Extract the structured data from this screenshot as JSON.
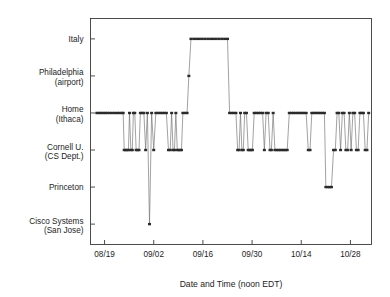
{
  "chart_data": {
    "type": "line",
    "title": "",
    "subtitle": "",
    "xlabel": "Date and Time (noon EDT)",
    "ylabel": "",
    "grid": false,
    "legend": null,
    "legend_position": "none",
    "marker": "square",
    "line_style": "step-connected",
    "series_color": "#2b2b2b",
    "y_type": "categorical",
    "y_categories": [
      "Cisco Systems\n(San Jose)",
      "Princeton",
      "Cornell U.\n(CS Dept.)",
      "Home\n(Ithaca)",
      "Philadelphia\n(airport)",
      "Italy"
    ],
    "y_tick_labels": [
      {
        "line1": "Italy",
        "line2": "",
        "value": 6
      },
      {
        "line1": "Philadelphia",
        "line2": "(airport)",
        "value": 5
      },
      {
        "line1": "Home",
        "line2": "(Ithaca)",
        "value": 4
      },
      {
        "line1": "Cornell U.",
        "line2": "(CS Dept.)",
        "value": 3
      },
      {
        "line1": "Princeton",
        "line2": "",
        "value": 2
      },
      {
        "line1": "Cisco Systems",
        "line2": "(San Jose)",
        "value": 1
      }
    ],
    "x_tick_labels": [
      "08/19",
      "09/02",
      "09/16",
      "09/30",
      "10/14",
      "10/28"
    ],
    "x_tick_days": [
      0,
      14,
      28,
      42,
      56,
      70
    ],
    "xlim_days": [
      -4,
      76
    ],
    "ylim": [
      0.45,
      6.55
    ],
    "x_axis_unit": "days since 08/19",
    "points": [
      [
        -2.2,
        4
      ],
      [
        -1.6,
        4
      ],
      [
        -1.0,
        4
      ],
      [
        -0.4,
        4
      ],
      [
        0.2,
        4
      ],
      [
        0.8,
        4
      ],
      [
        1.5,
        4
      ],
      [
        2.2,
        4
      ],
      [
        2.9,
        4
      ],
      [
        3.6,
        4
      ],
      [
        4.2,
        4
      ],
      [
        4.9,
        4
      ],
      [
        5.3,
        4
      ],
      [
        5.6,
        3
      ],
      [
        6.0,
        3
      ],
      [
        6.4,
        3
      ],
      [
        6.8,
        3
      ],
      [
        7.1,
        4
      ],
      [
        7.5,
        3
      ],
      [
        7.9,
        3
      ],
      [
        8.2,
        4
      ],
      [
        8.6,
        4
      ],
      [
        9.0,
        3
      ],
      [
        9.4,
        3
      ],
      [
        9.8,
        3
      ],
      [
        10.2,
        4
      ],
      [
        10.7,
        4
      ],
      [
        11.2,
        4
      ],
      [
        11.7,
        3
      ],
      [
        12.2,
        4
      ],
      [
        12.8,
        1
      ],
      [
        13.4,
        4
      ],
      [
        14.0,
        3
      ],
      [
        14.6,
        4
      ],
      [
        15.2,
        4
      ],
      [
        15.8,
        4
      ],
      [
        16.4,
        4
      ],
      [
        17.0,
        4
      ],
      [
        17.6,
        4
      ],
      [
        18.2,
        3
      ],
      [
        18.7,
        3
      ],
      [
        19.1,
        4
      ],
      [
        19.5,
        3
      ],
      [
        19.9,
        3
      ],
      [
        20.3,
        4
      ],
      [
        20.7,
        3
      ],
      [
        21.1,
        3
      ],
      [
        21.5,
        3
      ],
      [
        21.9,
        3
      ],
      [
        22.3,
        4
      ],
      [
        22.9,
        4
      ],
      [
        23.5,
        4
      ],
      [
        24.0,
        5
      ],
      [
        24.6,
        6
      ],
      [
        25.4,
        6
      ],
      [
        26.2,
        6
      ],
      [
        27.0,
        6
      ],
      [
        27.8,
        6
      ],
      [
        28.6,
        6
      ],
      [
        29.4,
        6
      ],
      [
        30.2,
        6
      ],
      [
        31.0,
        6
      ],
      [
        31.8,
        6
      ],
      [
        32.6,
        6
      ],
      [
        33.4,
        6
      ],
      [
        34.2,
        6
      ],
      [
        35.0,
        6
      ],
      [
        35.6,
        4
      ],
      [
        36.2,
        4
      ],
      [
        36.8,
        4
      ],
      [
        37.4,
        4
      ],
      [
        37.9,
        3
      ],
      [
        38.3,
        3
      ],
      [
        38.7,
        4
      ],
      [
        39.1,
        3
      ],
      [
        39.5,
        3
      ],
      [
        39.9,
        4
      ],
      [
        40.4,
        4
      ],
      [
        40.9,
        3
      ],
      [
        41.3,
        3
      ],
      [
        41.7,
        3
      ],
      [
        42.1,
        3
      ],
      [
        42.6,
        4
      ],
      [
        43.2,
        4
      ],
      [
        43.8,
        4
      ],
      [
        44.4,
        4
      ],
      [
        45.0,
        4
      ],
      [
        45.5,
        3
      ],
      [
        46.0,
        4
      ],
      [
        46.6,
        4
      ],
      [
        47.1,
        3
      ],
      [
        47.5,
        3
      ],
      [
        48.0,
        4
      ],
      [
        48.5,
        3
      ],
      [
        49.0,
        3
      ],
      [
        49.5,
        3
      ],
      [
        50.0,
        3
      ],
      [
        50.5,
        3
      ],
      [
        51.0,
        3
      ],
      [
        51.5,
        3
      ],
      [
        52.0,
        3
      ],
      [
        52.6,
        4
      ],
      [
        53.2,
        4
      ],
      [
        53.8,
        4
      ],
      [
        54.4,
        4
      ],
      [
        55.0,
        4
      ],
      [
        55.6,
        4
      ],
      [
        56.2,
        4
      ],
      [
        56.8,
        4
      ],
      [
        57.4,
        4
      ],
      [
        58.0,
        3
      ],
      [
        58.5,
        3
      ],
      [
        59.0,
        4
      ],
      [
        59.6,
        4
      ],
      [
        60.2,
        4
      ],
      [
        60.8,
        4
      ],
      [
        61.4,
        4
      ],
      [
        62.0,
        4
      ],
      [
        62.6,
        4
      ],
      [
        63.0,
        2
      ],
      [
        63.6,
        2
      ],
      [
        64.1,
        2
      ],
      [
        64.6,
        2
      ],
      [
        65.2,
        3
      ],
      [
        65.7,
        3
      ],
      [
        66.2,
        4
      ],
      [
        66.7,
        4
      ],
      [
        67.2,
        3
      ],
      [
        67.7,
        4
      ],
      [
        68.2,
        4
      ],
      [
        68.7,
        3
      ],
      [
        69.2,
        3
      ],
      [
        69.7,
        4
      ],
      [
        70.2,
        3
      ],
      [
        70.7,
        4
      ],
      [
        71.2,
        4
      ],
      [
        71.7,
        3
      ],
      [
        72.2,
        3
      ],
      [
        72.7,
        4
      ],
      [
        73.2,
        4
      ],
      [
        73.7,
        4
      ],
      [
        74.2,
        3
      ],
      [
        74.7,
        3
      ],
      [
        75.2,
        4
      ]
    ],
    "annotations": [
      {
        "label": "Italy trip plateau",
        "x_days_range": [
          24.6,
          35.0
        ],
        "y": 6
      },
      {
        "label": "Philadelphia airport layover",
        "x_days": 24.0,
        "y": 5
      },
      {
        "label": "Cisco San Jose single visit",
        "x_days": 12.8,
        "y": 1
      },
      {
        "label": "Princeton stay",
        "x_days_range": [
          63.0,
          64.6
        ],
        "y": 2
      }
    ]
  },
  "axes": {
    "x_axis_title": "Date and Time (noon EDT)",
    "frame_color": "#3a3a3a"
  }
}
